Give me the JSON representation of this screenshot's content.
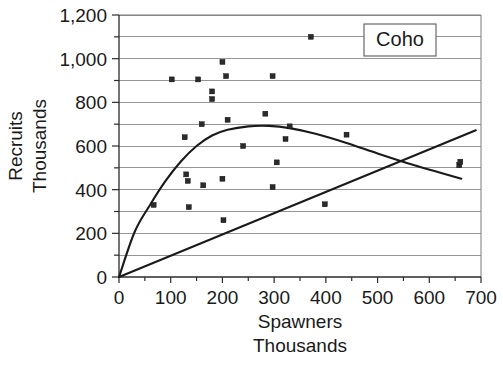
{
  "chart_data": {
    "type": "scatter",
    "title": "",
    "subtitle": "",
    "legend_label": "Coho",
    "legend_position": "top-right-inside",
    "grid": true,
    "grid_orientation": "horizontal",
    "xlabel": "Spawners",
    "xlabel_line2": "Thousands",
    "ylabel": "Recruits",
    "ylabel_line2": "Thousands",
    "xlim": [
      0,
      700
    ],
    "ylim": [
      0,
      1200
    ],
    "x_major_step": 100,
    "x_minor_step": 50,
    "y_major_step": 200,
    "y_minor_step": 100,
    "xticks": [
      0,
      100,
      200,
      300,
      400,
      500,
      600,
      700
    ],
    "xtick_labels": [
      "0",
      "100",
      "200",
      "300",
      "400",
      "500",
      "600",
      "700"
    ],
    "yticks": [
      0,
      200,
      400,
      600,
      800,
      1000,
      1200
    ],
    "ytick_labels": [
      "0",
      "200",
      "400",
      "600",
      "800",
      "1,000",
      "1,200"
    ],
    "y_gridline_values": [
      100,
      200,
      300,
      400,
      500,
      600,
      700,
      800,
      900,
      1000,
      1100,
      1200
    ],
    "series": [
      {
        "name": "Coho",
        "marker": "square",
        "marker_color": "#2b2b2b",
        "points": [
          {
            "x": 67,
            "y": 330
          },
          {
            "x": 102,
            "y": 905
          },
          {
            "x": 127,
            "y": 640
          },
          {
            "x": 130,
            "y": 470
          },
          {
            "x": 133,
            "y": 440
          },
          {
            "x": 135,
            "y": 320
          },
          {
            "x": 153,
            "y": 905
          },
          {
            "x": 160,
            "y": 700
          },
          {
            "x": 163,
            "y": 420
          },
          {
            "x": 180,
            "y": 850
          },
          {
            "x": 180,
            "y": 815
          },
          {
            "x": 200,
            "y": 985
          },
          {
            "x": 200,
            "y": 450
          },
          {
            "x": 202,
            "y": 260
          },
          {
            "x": 207,
            "y": 920
          },
          {
            "x": 210,
            "y": 720
          },
          {
            "x": 240,
            "y": 600
          },
          {
            "x": 283,
            "y": 748
          },
          {
            "x": 297,
            "y": 920
          },
          {
            "x": 297,
            "y": 412
          },
          {
            "x": 305,
            "y": 525
          },
          {
            "x": 322,
            "y": 632
          },
          {
            "x": 330,
            "y": 690
          },
          {
            "x": 371,
            "y": 1100
          },
          {
            "x": 398,
            "y": 333
          },
          {
            "x": 440,
            "y": 652
          },
          {
            "x": 658,
            "y": 512
          },
          {
            "x": 660,
            "y": 528
          }
        ]
      }
    ],
    "annotations": [
      {
        "kind": "fit-curve",
        "label": "Ricker stock-recruitment curve",
        "description": "rises steeply from origin, peaks near 690 at x=290, declines to about 450 at x=660",
        "path_points": [
          {
            "x": 0,
            "y": 0
          },
          {
            "x": 30,
            "y": 205
          },
          {
            "x": 60,
            "y": 330
          },
          {
            "x": 90,
            "y": 440
          },
          {
            "x": 120,
            "y": 530
          },
          {
            "x": 150,
            "y": 600
          },
          {
            "x": 180,
            "y": 648
          },
          {
            "x": 210,
            "y": 674
          },
          {
            "x": 250,
            "y": 690
          },
          {
            "x": 290,
            "y": 692
          },
          {
            "x": 330,
            "y": 682
          },
          {
            "x": 380,
            "y": 656
          },
          {
            "x": 440,
            "y": 614
          },
          {
            "x": 500,
            "y": 566
          },
          {
            "x": 560,
            "y": 520
          },
          {
            "x": 610,
            "y": 485
          },
          {
            "x": 662,
            "y": 450
          }
        ]
      },
      {
        "kind": "reference-line",
        "label": "1:1 replacement line",
        "description": "straight line from origin through to about 670 at x=690",
        "path_points": [
          {
            "x": 0,
            "y": 0
          },
          {
            "x": 690,
            "y": 672
          }
        ]
      }
    ]
  },
  "legend": {
    "label": "Coho"
  },
  "axes": {
    "x_title_line1": "Spawners",
    "x_title_line2": "Thousands",
    "y_title_line1": "Recruits",
    "y_title_line2": "Thousands"
  }
}
